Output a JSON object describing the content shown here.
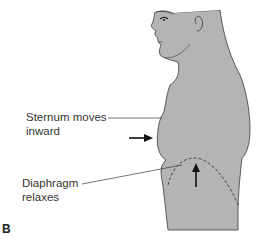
{
  "figure": {
    "panel_label": "B",
    "labels": {
      "sternum_line1": "Sternum moves",
      "sternum_line2": "inward",
      "diaphragm_line1": "Diaphragm",
      "diaphragm_line2": "relaxes"
    },
    "colors": {
      "body_fill": "#b4b4b4",
      "outline": "#3a3a3a",
      "text": "#333333",
      "background": "#ffffff"
    }
  }
}
